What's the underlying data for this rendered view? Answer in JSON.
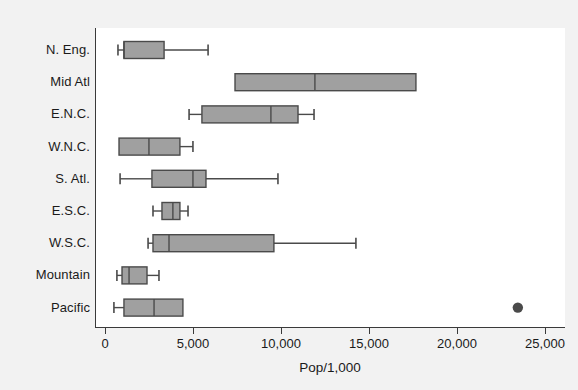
{
  "chart_data": {
    "type": "box",
    "title": "",
    "xlabel": "Pop/1,000",
    "ylabel": "",
    "orientation": "horizontal",
    "xlim": [
      0,
      26000
    ],
    "grid": false,
    "legend": null,
    "box_fill": "#a0a0a0",
    "box_stroke": "#4a4a4a",
    "outlier_color": "#4a4a4a",
    "xticks": [
      {
        "value": 0,
        "label": "0"
      },
      {
        "value": 5000,
        "label": "5,000"
      },
      {
        "value": 10000,
        "label": "10,000"
      },
      {
        "value": 15000,
        "label": "15,000"
      },
      {
        "value": 20000,
        "label": "20,000"
      },
      {
        "value": 25000,
        "label": "25,000"
      }
    ],
    "categories": [
      "N. Eng.",
      "Mid Atl",
      "E.N.C.",
      "W.N.C.",
      "S. Atl.",
      "E.S.C.",
      "W.S.C.",
      "Mountain",
      "Pacific"
    ],
    "boxes": [
      {
        "category": "N. Eng.",
        "whisker_low": 680,
        "q1": 1020,
        "median": 1020,
        "q3": 3300,
        "whisker_high": 5800,
        "outliers": []
      },
      {
        "category": "Mid Atl",
        "whisker_low": 7330,
        "q1": 7330,
        "median": 11870,
        "q3": 17610,
        "whisker_high": 17610,
        "outliers": []
      },
      {
        "category": "E.N.C.",
        "whisker_low": 4720,
        "q1": 5450,
        "median": 9370,
        "q3": 10910,
        "whisker_high": 11820,
        "outliers": []
      },
      {
        "category": "W.N.C.",
        "whisker_low": 740,
        "q1": 740,
        "median": 2440,
        "q3": 4200,
        "whisker_high": 4940,
        "outliers": []
      },
      {
        "category": "S. Atl.",
        "whisker_low": 800,
        "q1": 2610,
        "median": 4940,
        "q3": 5680,
        "whisker_high": 9770,
        "outliers": []
      },
      {
        "category": "E.S.C.",
        "whisker_low": 2670,
        "q1": 3180,
        "median": 3800,
        "q3": 4200,
        "whisker_high": 4660,
        "outliers": []
      },
      {
        "category": "W.S.C.",
        "whisker_low": 2390,
        "q1": 2670,
        "median": 3580,
        "q3": 9540,
        "whisker_high": 14200,
        "outliers": []
      },
      {
        "category": "Mountain",
        "whisker_low": 620,
        "q1": 910,
        "median": 1310,
        "q3": 2330,
        "whisker_high": 3010,
        "outliers": []
      },
      {
        "category": "Pacific",
        "whisker_low": 450,
        "q1": 1020,
        "median": 2730,
        "q3": 4370,
        "whisker_high": 4370,
        "outliers": [
          23400
        ]
      }
    ]
  },
  "axis_geometry": {
    "x_origin_px": 10,
    "px_per_unit": 0.0176,
    "row_height_px": 32.2,
    "row_first_center_px": 22,
    "box_height_px": 17,
    "cap_height_px": 11
  }
}
